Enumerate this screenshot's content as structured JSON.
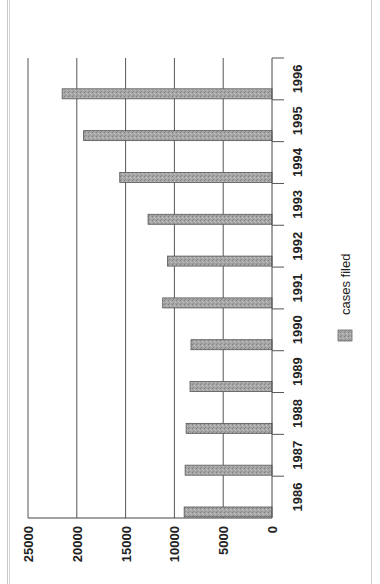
{
  "chart_data": {
    "type": "bar",
    "orientation": "rotated-90-clockwise",
    "title": "",
    "xlabel": "",
    "ylabel": "",
    "categories": [
      "1986",
      "1987",
      "1988",
      "1989",
      "1990",
      "1991",
      "1992",
      "1993",
      "1994",
      "1995",
      "1996"
    ],
    "series": [
      {
        "name": "cases filed",
        "values": [
          9000,
          8900,
          8800,
          8400,
          8300,
          11200,
          10700,
          12700,
          15600,
          19300,
          21500
        ]
      }
    ],
    "ylim": [
      0,
      25000
    ],
    "yticks": [
      "0",
      "5000",
      "10000",
      "15000",
      "20000",
      "25000"
    ],
    "grid": true,
    "legend": {
      "position": "right",
      "entries": [
        "cases filed"
      ]
    },
    "colors": {
      "bar": "#9a9a9a",
      "bar_edge": "#555555",
      "grid": "#555555"
    }
  }
}
